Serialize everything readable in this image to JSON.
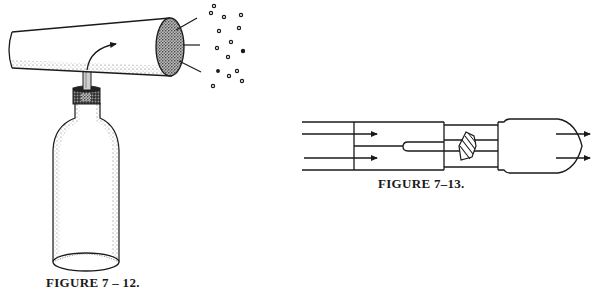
{
  "figures": [
    {
      "id": "7-12",
      "caption": "FIGURE 7 – 12.",
      "description": "Atomizer: a conical tube mounted on a bottle with a straw; an arrow shows air flow, and droplets spray out of the wide end.",
      "elements": [
        "conical-tube",
        "air-flow-arrow",
        "straw",
        "bottle-cap",
        "bottle",
        "spray-lines",
        "spray-droplets"
      ],
      "droplet_count": 15
    },
    {
      "id": "7-13",
      "caption": "FIGURE 7–13.",
      "description": "Carburetor-style flow diagram: air flows in from the left, past a nozzle tube and throttle valve, and exits to the right.",
      "elements": [
        "inlet-channel",
        "flow-arrows-in",
        "fuel-nozzle",
        "throttle-valve",
        "outlet-chamber",
        "flow-arrows-out"
      ]
    }
  ],
  "colors": {
    "ink": "#1a1a1a",
    "background": "#ffffff",
    "stipple": "#555555"
  }
}
